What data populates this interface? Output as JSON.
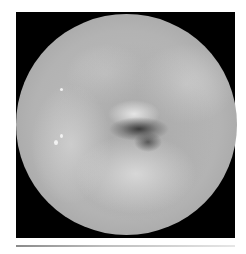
{
  "image": {
    "subject": "endoscopic-view",
    "description": "Grayscale circular endoscopic image of tissue with a central dark lumen opening, shown inside a black square frame",
    "colors": {
      "frame": "#000000",
      "tissue_base": "#b3b3b3",
      "lumen": "#3a3a3a",
      "background": "#ffffff",
      "rule": "#bdbdbd"
    }
  }
}
